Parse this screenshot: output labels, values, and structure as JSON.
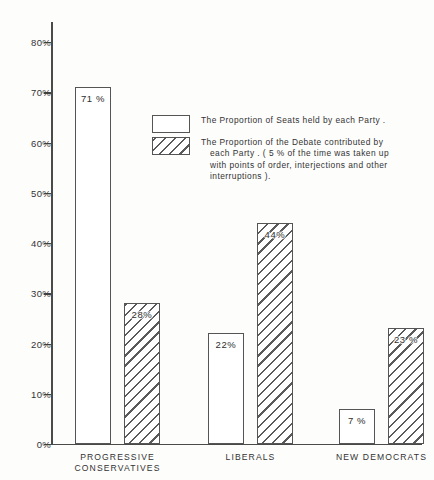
{
  "chart_data": {
    "type": "bar",
    "title": "",
    "subtitle": "",
    "xlabel": "",
    "ylabel": "",
    "ylim": [
      0,
      80
    ],
    "grid": false,
    "legend_position": "inside-upper-center",
    "categories": [
      "PROGRESSIVE CONSERVATIVES",
      "LIBERALS",
      "NEW DEMOCRATS"
    ],
    "category_lines": [
      [
        "PROGRESSIVE",
        "CONSERVATIVES"
      ],
      [
        "LIBERALS"
      ],
      [
        "NEW DEMOCRATS"
      ]
    ],
    "series": [
      {
        "name": "The Proportion of Seats held by each Party.",
        "fill": "solid",
        "values": [
          71,
          22,
          7
        ],
        "labels": [
          "71 %",
          "22%",
          "7 %"
        ]
      },
      {
        "name": "The Proportion of the Debate contributed by each Party.",
        "fill": "hatched",
        "values": [
          28,
          44,
          23
        ],
        "labels": [
          "28%",
          "44%",
          "23 %"
        ]
      }
    ],
    "y_ticks": [
      0,
      10,
      20,
      30,
      40,
      50,
      60,
      70,
      80
    ],
    "y_tick_labels": [
      "0%",
      "10%",
      "20%",
      "30%",
      "40%",
      "50%",
      "60%",
      "70%",
      "80%"
    ],
    "annotations": [
      "( 5 % of the time was taken up with points of order, interjections and other interruptions)."
    ]
  },
  "legend": {
    "items": [
      {
        "swatch": "solid",
        "lines": [
          {
            "text": "The Proportion of  Seats  held  by  each Party .",
            "indent": false
          }
        ]
      },
      {
        "swatch": "hatched",
        "lines": [
          {
            "text": "The Proportion  of  the  Debate  contributed by",
            "indent": false
          },
          {
            "text": "each  Party .  ( 5 %  of  the  time  was  taken  up",
            "indent": true
          },
          {
            "text": "with points  of  order,  interjections  and  other",
            "indent": true
          },
          {
            "text": "interruptions ).",
            "indent": true
          }
        ]
      }
    ]
  },
  "axis": {
    "y_tick_labels": [
      "80%",
      "70%",
      "60%",
      "50%",
      "40%",
      "30%",
      "20%",
      "10%",
      "0%"
    ]
  },
  "colors": {
    "ink": "#4a4a4a",
    "hatch": "#5a5a5a",
    "background": "#fdfdfc",
    "text": "#333333"
  }
}
